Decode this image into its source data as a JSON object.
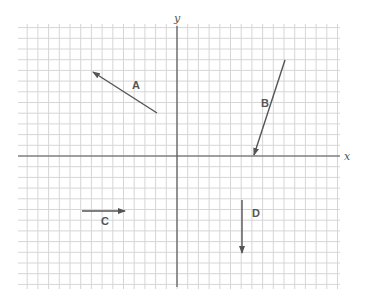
{
  "diagram": {
    "type": "coordinate-grid-vectors",
    "axes": {
      "x_label": "x",
      "y_label": "y"
    },
    "grid": {
      "left": 18,
      "top": 28,
      "right": 340,
      "bottom": 285,
      "spacing": 10.7,
      "origin_px": [
        177,
        156
      ],
      "line_color": "#d6d6d6",
      "axis_color": "#555555"
    },
    "vectors": [
      {
        "label": "A",
        "from": [
          157,
          113
        ],
        "to": [
          93,
          72
        ],
        "label_pos": [
          132,
          89
        ]
      },
      {
        "label": "B",
        "from": [
          285,
          60
        ],
        "to": [
          254,
          155
        ],
        "label_pos": [
          261,
          107
        ]
      },
      {
        "label": "C",
        "from": [
          82,
          211
        ],
        "to": [
          125,
          211
        ],
        "label_pos": [
          101,
          225
        ]
      },
      {
        "label": "D",
        "from": [
          242,
          200
        ],
        "to": [
          242,
          253
        ],
        "label_pos": [
          252,
          217
        ]
      }
    ],
    "vector_color": "#555555"
  }
}
